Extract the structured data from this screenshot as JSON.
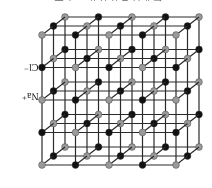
{
  "diagram": {
    "caption_cropped": "氯化钠晶体结构示意图",
    "labels": {
      "chloride": "Cl⁻",
      "sodium": "Na⁺"
    },
    "lattice": {
      "nx": 5,
      "ny": 5,
      "nz": 3,
      "origin": [
        42,
        35
      ],
      "step_x": 33.5,
      "step_y": 32.5,
      "depth_dx": 11.5,
      "depth_dy": -9,
      "ball_radius": 3.4,
      "colors": {
        "na_ion": "#9a9a9a",
        "cl_ion": "#111111",
        "bond": "#2a2a2a"
      }
    }
  }
}
